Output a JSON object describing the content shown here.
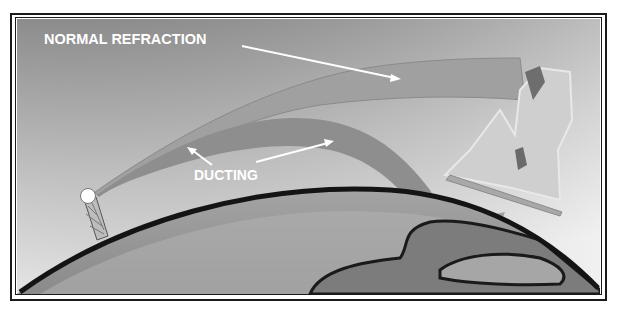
{
  "diagram": {
    "labels": {
      "normal_refraction": "NORMAL REFRACTION",
      "ducting": "DUCTING"
    },
    "colors": {
      "sky_top": "#8a8a8a",
      "sky_bottom": "#e6e6e6",
      "beam_normal": "#9a9a9a",
      "beam_duct": "#8c8c8c",
      "earth_outline": "#141414",
      "earth_fill": "#9c9c9c",
      "land": "#7e7e7e",
      "label": "#ffffff"
    },
    "elements": [
      "radar-antenna",
      "normal-refraction-beam",
      "ducting-beam",
      "earth-curvature",
      "mountain-target"
    ]
  }
}
